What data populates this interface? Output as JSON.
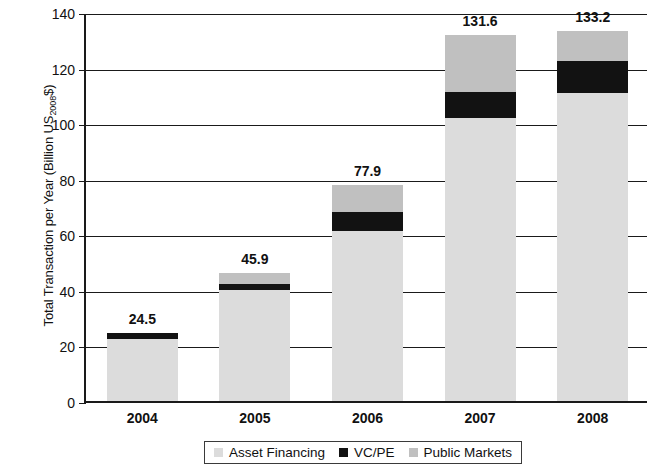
{
  "chart_data": {
    "type": "bar",
    "subtype": "stacked-bar",
    "title": "",
    "xlabel": "",
    "ylabel": "Total Transaction per Year (Billion US2008$)",
    "ylabel_base": "Total Transaction per Year (Billion US",
    "ylabel_sub": "2008",
    "ylabel_tail": "$)",
    "categories": [
      "2004",
      "2005",
      "2006",
      "2007",
      "2008"
    ],
    "ylim": [
      0,
      140
    ],
    "yticks": [
      0,
      20,
      40,
      60,
      80,
      100,
      120,
      140
    ],
    "ytick_labels": [
      "0",
      "20",
      "40",
      "60",
      "80",
      "100",
      "120",
      "140"
    ],
    "grid": "horizontal",
    "legend_position": "bottom",
    "series": [
      {
        "name": "Asset Financing",
        "color": "#dcdcdc",
        "values": [
          22.3,
          39.8,
          61.2,
          102.0,
          111.0
        ]
      },
      {
        "name": "VC/PE",
        "color": "#121212",
        "values": [
          2.2,
          2.3,
          6.9,
          9.3,
          11.2
        ]
      },
      {
        "name": "Public Markets",
        "color": "#c0c0c0",
        "values": [
          0.0,
          3.8,
          9.8,
          20.3,
          11.0
        ]
      }
    ],
    "totals": [
      24.5,
      45.9,
      77.9,
      131.6,
      133.2
    ],
    "total_labels": [
      "24.5",
      "45.9",
      "77.9",
      "131.6",
      "133.2"
    ]
  },
  "legend": {
    "items": [
      {
        "label": "Asset Financing",
        "swatch": "asset"
      },
      {
        "label": "VC/PE",
        "swatch": "vcpe"
      },
      {
        "label": "Public Markets",
        "swatch": "public"
      }
    ]
  }
}
